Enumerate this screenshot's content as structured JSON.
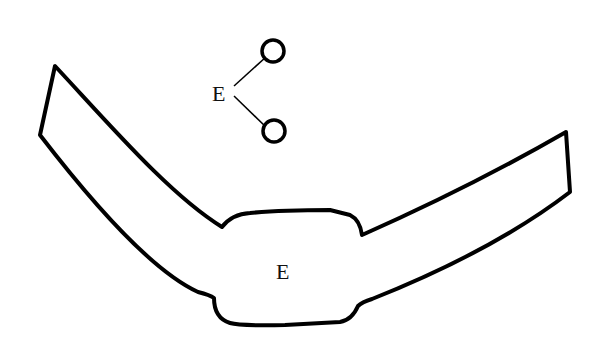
{
  "diagram": {
    "legend_label": "E",
    "center_label": "E",
    "colors": {
      "stroke": "#000000",
      "background": "#ffffff",
      "text": "#111111"
    }
  }
}
